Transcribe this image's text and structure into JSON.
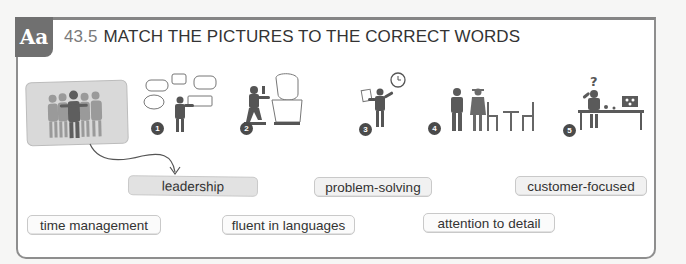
{
  "exercise": {
    "badge": "Aa",
    "number": "43.5",
    "title": "MATCH THE PICTURES TO THE CORRECT WORDS"
  },
  "pictures": [
    {
      "id": "example",
      "label": "",
      "icon": "team-group-icon",
      "description": "group of people with arms around each other"
    },
    {
      "id": "1",
      "label": "1",
      "icon": "speaker-speech-bubbles-icon",
      "description": "person surrounded by speech bubbles"
    },
    {
      "id": "2",
      "label": "2",
      "icon": "sculptor-bust-icon",
      "description": "kneeling person carving a bust"
    },
    {
      "id": "3",
      "label": "3",
      "icon": "person-clock-document-icon",
      "description": "person holding paper pointing at clock"
    },
    {
      "id": "4",
      "label": "4",
      "icon": "waiter-customer-table-icon",
      "description": "waiter with customer at table"
    },
    {
      "id": "5",
      "label": "5",
      "icon": "confused-person-desk-icon",
      "description": "person with question mark at desk"
    }
  ],
  "words": [
    {
      "text": "leadership",
      "state": "matched-example"
    },
    {
      "text": "problem-solving",
      "state": "available"
    },
    {
      "text": "customer-focused",
      "state": "available"
    },
    {
      "text": "time management",
      "state": "available"
    },
    {
      "text": "fluent in languages",
      "state": "available"
    },
    {
      "text": "attention to detail",
      "state": "available"
    }
  ],
  "colors": {
    "badge": "#707070",
    "border": "#8e8e8e",
    "figure_dark": "#5a5a5a",
    "figure_light": "#8f8f8f",
    "card": "#d9d9d9",
    "chip": "#f1f1f1"
  }
}
